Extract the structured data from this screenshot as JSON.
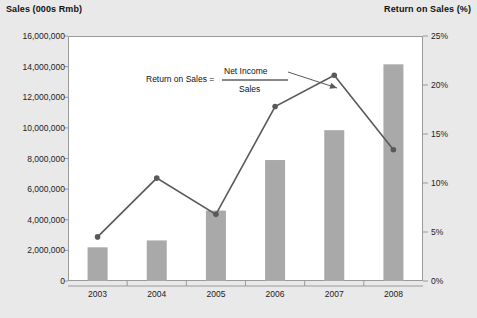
{
  "left_axis_title": "Sales (000s Rmb)",
  "right_axis_title": "Return on Sales (%)",
  "annotation": {
    "label": "Return on Sales  =",
    "numerator": "Net Income",
    "denominator": "Sales"
  },
  "colors": {
    "background": "#e9e9e9",
    "plot_background": "#ffffff",
    "bar_fill": "#a9a9a9",
    "line_color": "#595959",
    "axis_color": "#9a9a9a",
    "text": "#1a1a1a"
  },
  "chart_data": {
    "type": "bar",
    "title": "",
    "subtitle": "",
    "xlabel": "",
    "ylabel": "Sales (000s Rmb)",
    "y2label": "Return on Sales (%)",
    "grid": false,
    "legend": "none",
    "categories": [
      "2003",
      "2004",
      "2005",
      "2006",
      "2007",
      "2008"
    ],
    "ylim": [
      0,
      16000000
    ],
    "yticks": [
      0,
      2000000,
      4000000,
      6000000,
      8000000,
      10000000,
      12000000,
      14000000,
      16000000
    ],
    "ytick_labels": [
      "0",
      "2,000,000",
      "4,000,000",
      "6,000,000",
      "8,000,000",
      "10,000,000",
      "12,000,000",
      "14,000,000",
      "16,000,000"
    ],
    "y2lim": [
      0,
      25
    ],
    "y2ticks": [
      0,
      5,
      10,
      15,
      20,
      25
    ],
    "y2tick_labels": [
      "0%",
      "5%",
      "10%",
      "15%",
      "20%",
      "25%"
    ],
    "series": [
      {
        "name": "Sales",
        "type": "bar",
        "axis": "left",
        "values": [
          2200000,
          2650000,
          4600000,
          7900000,
          9850000,
          14150000
        ]
      },
      {
        "name": "Return on Sales",
        "type": "line",
        "axis": "right",
        "values": [
          4.5,
          10.5,
          6.8,
          17.8,
          21.0,
          13.4
        ]
      }
    ],
    "annotations": [
      {
        "text": "Return on Sales = Net Income / Sales",
        "target_series": "Return on Sales",
        "target_category": "2006"
      }
    ]
  }
}
